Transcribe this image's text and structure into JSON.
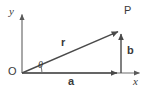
{
  "figure": {
    "kind": "vector-decomposition-diagram",
    "width": 146,
    "height": 95,
    "background_color": "#ffffff",
    "stroke_color": "#5a5a5a",
    "text_color": "#3a3a3a"
  },
  "axes": {
    "y_axis_label": "y",
    "x_axis_label": "x",
    "origin_label": "O",
    "origin_px": {
      "x": 22,
      "y": 73
    },
    "y_axis_tip_px": {
      "x": 22,
      "y": 13
    },
    "x_axis_tip_px": {
      "x": 141,
      "y": 73
    }
  },
  "points": {
    "P": {
      "label": "P",
      "px": {
        "x": 122,
        "y": 29
      }
    }
  },
  "vectors": [
    {
      "name": "r",
      "label": "r",
      "style": "bold",
      "from_px": {
        "x": 22,
        "y": 73
      },
      "to_px": {
        "x": 122,
        "y": 30
      },
      "description": "resultant position vector from origin O to point P"
    },
    {
      "name": "a",
      "label": "a",
      "style": "bold",
      "from_px": {
        "x": 22,
        "y": 73
      },
      "to_px": {
        "x": 121,
        "y": 73
      },
      "description": "horizontal component along the x-axis"
    },
    {
      "name": "b",
      "label": "b",
      "style": "bold",
      "from_px": {
        "x": 121,
        "y": 73
      },
      "to_px": {
        "x": 121,
        "y": 30
      },
      "description": "vertical component parallel to the y-axis"
    }
  ],
  "angle": {
    "label": "θ",
    "vertex_px": {
      "x": 22,
      "y": 73
    },
    "between": [
      "a",
      "r"
    ],
    "arc_radius_px": 20
  }
}
